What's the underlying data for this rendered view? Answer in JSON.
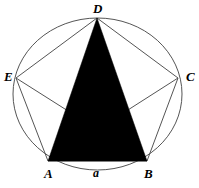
{
  "figure": {
    "background_color": "#ffffff",
    "stroke_color": "#555555",
    "fill_color": "#000000",
    "label_color": "#000000",
    "circle": {
      "center_x": 97.5,
      "center_y": 94,
      "radius_x": 84.5,
      "radius_y": 76,
      "stroke_width": 1
    },
    "vertices": [
      {
        "id": "A",
        "label": "A",
        "x": 48,
        "y": 161
      },
      {
        "id": "B",
        "label": "B",
        "x": 147,
        "y": 161
      },
      {
        "id": "C",
        "label": "C",
        "x": 178,
        "y": 78
      },
      {
        "id": "D",
        "label": "D",
        "x": 97,
        "y": 18
      },
      {
        "id": "E",
        "label": "E",
        "x": 16,
        "y": 78
      }
    ],
    "pentagon_path": "48,161 147,161 178,78 97,18 16,78",
    "shaded_triangle": {
      "name": "triangle-ABD",
      "path": "48,161 147,161 97,18",
      "fill": "#000000"
    },
    "diagonals": [
      {
        "name": "diagonal-EB",
        "from": "E",
        "to": "B",
        "x1": 16,
        "y1": 78,
        "x2": 147,
        "y2": 161
      },
      {
        "name": "diagonal-CA",
        "from": "C",
        "to": "A",
        "x1": 178,
        "y1": 78,
        "x2": 48,
        "y2": 161
      },
      {
        "name": "diagonal-DA",
        "from": "D",
        "to": "A",
        "x1": 97,
        "y1": 18,
        "x2": 48,
        "y2": 161
      },
      {
        "name": "diagonal-DB",
        "from": "D",
        "to": "B",
        "x1": 97,
        "y1": 18,
        "x2": 147,
        "y2": 161
      }
    ],
    "side_labels": [
      {
        "id": "a",
        "label": "a",
        "side": "AB"
      }
    ]
  }
}
